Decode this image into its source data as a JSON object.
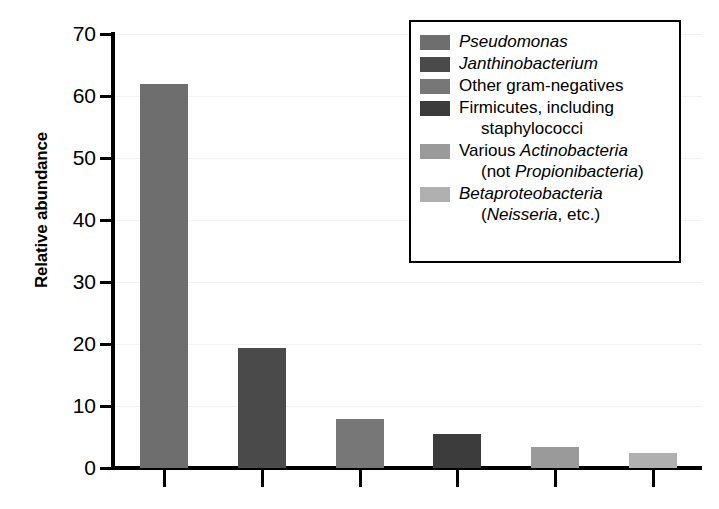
{
  "chart_data": {
    "type": "bar",
    "title": "",
    "xlabel": "",
    "ylabel": "Relative abundance",
    "ylim": [
      0,
      70
    ],
    "ytick_values": [
      70,
      60,
      50,
      40,
      30,
      20,
      10,
      0
    ],
    "ytick_labels": [
      "70",
      "60",
      "50",
      "40",
      "30",
      "20",
      "10",
      "0"
    ],
    "grid": true,
    "legend_position": "top-right",
    "xtick_labels": [
      "",
      "",
      "",
      "",
      "",
      ""
    ],
    "categories": [
      "Pseudomonas",
      "Janthinobacterium",
      "Other gram-negatives",
      "Firmicutes, including staphylococci",
      "Various Actinobacteria (not Propionibacteria)",
      "Betaproteobacteria (Neisseria, etc.)"
    ],
    "values": [
      62,
      19.3,
      7.9,
      5.5,
      3.4,
      2.4
    ],
    "colors": [
      "#6e6e6e",
      "#4a4a4a",
      "#777777",
      "#3c3c3c",
      "#9a9a9a",
      "#b0b0b0"
    ]
  },
  "axis": {
    "y_title": "Relative abundance"
  },
  "legend": {
    "entries": [
      {
        "color": "#6e6e6e",
        "line1_pre": "",
        "line1_italic": "Pseudomonas",
        "line1_post": "",
        "line2_pre": "",
        "line2_italic": "",
        "line2_post": ""
      },
      {
        "color": "#4a4a4a",
        "line1_pre": "",
        "line1_italic": "Janthinobacterium",
        "line1_post": "",
        "line2_pre": "",
        "line2_italic": "",
        "line2_post": ""
      },
      {
        "color": "#777777",
        "line1_pre": "Other gram-negatives",
        "line1_italic": "",
        "line1_post": "",
        "line2_pre": "",
        "line2_italic": "",
        "line2_post": ""
      },
      {
        "color": "#3c3c3c",
        "line1_pre": "Firmicutes, including",
        "line1_italic": "",
        "line1_post": "",
        "line2_pre": "staphylococci",
        "line2_italic": "",
        "line2_post": ""
      },
      {
        "color": "#9a9a9a",
        "line1_pre": "Various ",
        "line1_italic": "Actinobacteria",
        "line1_post": "",
        "line2_pre": "(not ",
        "line2_italic": "Propionibacteria",
        "line2_post": ")"
      },
      {
        "color": "#b0b0b0",
        "line1_pre": "",
        "line1_italic": "Betaproteobacteria",
        "line1_post": "",
        "line2_pre": "(",
        "line2_italic": "Neisseria",
        "line2_post": ", etc.)"
      }
    ]
  }
}
